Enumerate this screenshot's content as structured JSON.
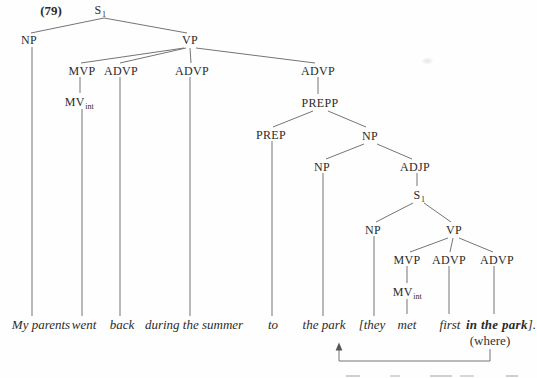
{
  "figure": {
    "example_number": "(79)"
  },
  "tree": {
    "nodes": {
      "s1_root": {
        "main": "S",
        "sub": "1"
      },
      "np_subject": {
        "main": "NP"
      },
      "vp_main": {
        "main": "VP"
      },
      "mvp_main": {
        "main": "MVP"
      },
      "advp_back": {
        "main": "ADVP"
      },
      "advp_during": {
        "main": "ADVP"
      },
      "advp_pp": {
        "main": "ADVP"
      },
      "mv_int_went": {
        "main": "MV",
        "sub": "int"
      },
      "prepp": {
        "main": "PREPP"
      },
      "prep": {
        "main": "PREP"
      },
      "np_object": {
        "main": "NP"
      },
      "np_the_park": {
        "main": "NP"
      },
      "adjp": {
        "main": "ADJP"
      },
      "s1_embedded": {
        "main": "S",
        "sub": "1"
      },
      "np_they": {
        "main": "NP"
      },
      "vp_embedded": {
        "main": "VP"
      },
      "mvp_embedded": {
        "main": "MVP"
      },
      "advp_first": {
        "main": "ADVP"
      },
      "advp_in_the_park": {
        "main": "ADVP"
      },
      "mv_int_met": {
        "main": "MV",
        "sub": "int"
      }
    },
    "terminals": {
      "my_parents": "My parents",
      "went": "went",
      "back": "back",
      "during_the_summer": "during the summer",
      "to": "to",
      "the_park": "the park",
      "they": "[they",
      "met": "met",
      "first": "first",
      "in_the_park": {
        "bold": "in the park",
        "suffix": "]."
      }
    },
    "annotation": "(where)"
  },
  "colors": {
    "text": "#2b2b2b",
    "edge": "#757575",
    "background": "#fefefe"
  }
}
